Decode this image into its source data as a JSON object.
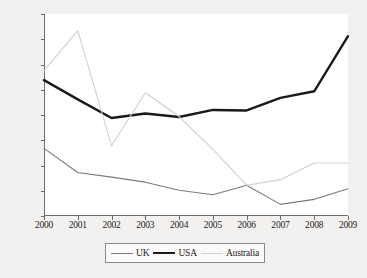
{
  "chart_data": {
    "type": "line",
    "title": "",
    "xlabel": "",
    "ylabel": "",
    "categories": [
      "2000",
      "2001",
      "2002",
      "2003",
      "2004",
      "2005",
      "2006",
      "2007",
      "2008",
      "2009"
    ],
    "x": [
      2000,
      2001,
      2002,
      2003,
      2004,
      2005,
      2006,
      2007,
      2008,
      2009
    ],
    "ylim": [
      0,
      40
    ],
    "ytick_values": [
      0,
      5,
      10,
      15,
      20,
      25,
      30,
      35,
      40
    ],
    "ytick_labels": [
      "0%",
      "5%",
      "10%",
      "15%",
      "20%",
      "25%",
      "30%",
      "35%",
      "40%"
    ],
    "grid": false,
    "legend_position": "bottom-center",
    "series": [
      {
        "name": "UK",
        "color": "#7a7a7a",
        "width": 1.1,
        "values": [
          13.4,
          8.6,
          7.7,
          6.7,
          5.1,
          4.2,
          6.1,
          2.3,
          3.3,
          5.4
        ]
      },
      {
        "name": "USA",
        "color": "#1a1a1a",
        "width": 2.4,
        "values": [
          26.9,
          23.1,
          19.4,
          20.3,
          19.6,
          21.0,
          20.9,
          23.4,
          24.7,
          35.6
        ]
      },
      {
        "name": "Australia",
        "color": "#cfcfcf",
        "width": 1.1,
        "values": [
          28.8,
          36.7,
          13.9,
          24.4,
          19.7,
          13.2,
          6.1,
          7.2,
          10.5,
          10.5
        ]
      }
    ]
  },
  "legend": {
    "entries": [
      {
        "label": "UK"
      },
      {
        "label": "USA"
      },
      {
        "label": "Australia"
      }
    ]
  }
}
